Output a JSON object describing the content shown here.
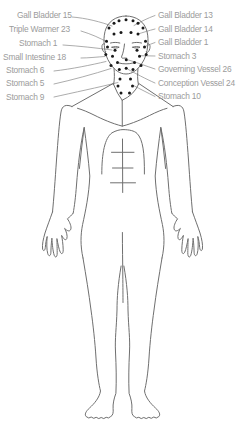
{
  "diagram": {
    "colors": {
      "background": "#ffffff",
      "label_text": "#9b9b9b",
      "leader_line": "#9d9d9d",
      "body_outline": "#6f6f6f",
      "point_dot": "#1a1a1a"
    }
  },
  "labels": {
    "left": [
      "Gall Bladder 15",
      "Triple Warmer 23",
      "Stomach 1",
      "Small Intestine 18",
      "Stomach 6",
      "Stomach 5",
      "Stomach 9"
    ],
    "right": [
      "Gall Bladder 13",
      "Gall Bladder 14",
      "Gall Bladder 1",
      "Stomach 3",
      "Governing Vessel 26",
      "Conception Vessel 24",
      "Stomach 10"
    ]
  },
  "acupoints": {
    "dot_radius": 1.5,
    "dots": [
      [
        114,
        23.2
      ],
      [
        119,
        20.8
      ],
      [
        126,
        19.8
      ],
      [
        133,
        20.8
      ],
      [
        138,
        23.2
      ],
      [
        109,
        28
      ],
      [
        143,
        28
      ],
      [
        114,
        34
      ],
      [
        121,
        32.4
      ],
      [
        131,
        32.4
      ],
      [
        138,
        34
      ],
      [
        106.5,
        41.3
      ],
      [
        145.5,
        41.3
      ],
      [
        107.5,
        47
      ],
      [
        144.5,
        47
      ],
      [
        115,
        50.2
      ],
      [
        137,
        50.2
      ],
      [
        105.8,
        54.6
      ],
      [
        146.2,
        54.6
      ],
      [
        112.5,
        56.3
      ],
      [
        139.5,
        56.3
      ],
      [
        126.3,
        59.8
      ],
      [
        117.5,
        62.6
      ],
      [
        134.5,
        62.6
      ],
      [
        111,
        65.4
      ],
      [
        141,
        65.4
      ],
      [
        126.2,
        68.3
      ],
      [
        119.3,
        69.6
      ],
      [
        133,
        69.6
      ],
      [
        120,
        79
      ],
      [
        130.5,
        79
      ],
      [
        118,
        86
      ],
      [
        132.5,
        86
      ],
      [
        121,
        93
      ],
      [
        129.5,
        93
      ]
    ]
  }
}
